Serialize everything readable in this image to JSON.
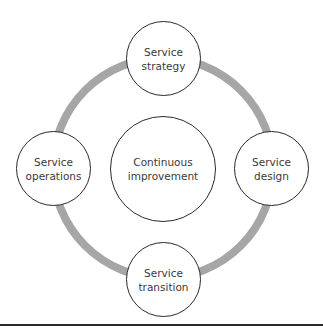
{
  "diagram": {
    "center": {
      "label": "Continuous\nimprovement"
    },
    "nodes": [
      {
        "id": "strategy",
        "label": "Service\nstrategy"
      },
      {
        "id": "design",
        "label": "Service\ndesign"
      },
      {
        "id": "transition",
        "label": "Service\ntransition"
      },
      {
        "id": "operations",
        "label": "Service\noperations"
      }
    ],
    "colors": {
      "ring": "#a6a6a6",
      "node_border": "#2a2a2a",
      "text": "#3a3a3a",
      "rule": "#2a2a2a"
    }
  }
}
